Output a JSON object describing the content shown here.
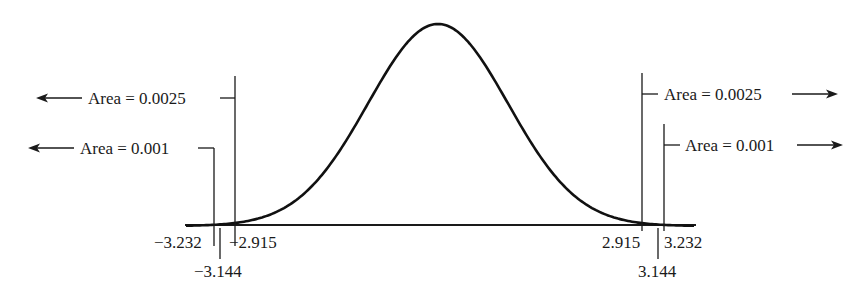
{
  "annotations": {
    "left_outer": {
      "label": "Area = 0.0025",
      "direction": "left"
    },
    "left_inner": {
      "label": "Area = 0.001",
      "direction": "left"
    },
    "right_outer": {
      "label": "Area = 0.0025",
      "direction": "right"
    },
    "right_inner": {
      "label": "Area = 0.001",
      "direction": "right"
    }
  },
  "ticks": {
    "neg_3_232": "−3.232",
    "neg_2_915": "−2.915",
    "neg_3_144": "−3.144",
    "pos_2_915": "2.915",
    "pos_3_232": "3.232",
    "pos_3_144": "3.144"
  },
  "colors": {
    "ink": "#1a1a1a",
    "background": "#ffffff"
  }
}
